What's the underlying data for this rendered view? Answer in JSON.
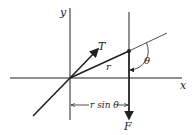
{
  "labels": {
    "y_axis": "y",
    "x_axis": "x",
    "tension": "T",
    "radius": "r",
    "angle": "θ",
    "force": "F",
    "moment_arm": "r sin θ"
  },
  "colors": {
    "stroke": "#222222",
    "background": "#ffffff"
  }
}
